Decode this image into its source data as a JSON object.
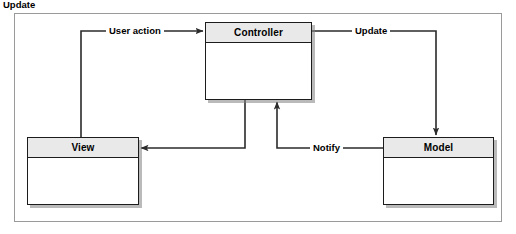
{
  "diagram": {
    "type": "mvc-pattern-diagram",
    "nodes": [
      {
        "id": "controller",
        "title": "Controller"
      },
      {
        "id": "view",
        "title": "View"
      },
      {
        "id": "model",
        "title": "Model"
      }
    ],
    "edges": [
      {
        "id": "user-action",
        "label": "User action",
        "from": "view",
        "to": "controller"
      },
      {
        "id": "update-top",
        "label": "Update",
        "from": "controller",
        "to": "model"
      },
      {
        "id": "notify",
        "label": "Notify",
        "from": "model",
        "to": "controller"
      },
      {
        "id": "update-bottom",
        "label": "Update",
        "from": "controller",
        "to": "view"
      }
    ],
    "colors": {
      "header_fill": "#e9e9e9",
      "box_border": "#1c1c1c",
      "body_fill": "#ffffff",
      "connector": "#2b2b2b",
      "frame_border": "#9a9a9a",
      "shadow": "#828282"
    }
  }
}
